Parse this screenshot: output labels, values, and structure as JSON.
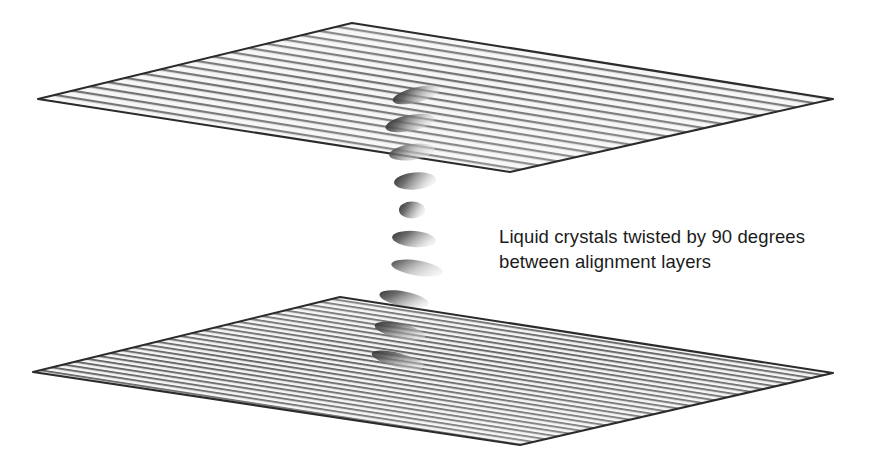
{
  "figure": {
    "width": 879,
    "height": 460,
    "background_color": "#ffffff"
  },
  "caption": {
    "line1": "Liquid crystals twisted by 90 degrees",
    "line2": "between alignment layers",
    "text_color": "#1b1b1b",
    "font_size_px": 18.5
  },
  "plates": [
    {
      "name": "top-alignment-layer",
      "label": "top alignment layer",
      "edge_color": "#2b2b2b",
      "fill_color": "#f4f4f4",
      "groove_color": "#4a4a4a",
      "groove_spacing_px": 7,
      "groove_count": 21,
      "vertices": [
        {
          "x": 352,
          "y": 23
        },
        {
          "x": 833,
          "y": 99
        },
        {
          "x": 510,
          "y": 172
        },
        {
          "x": 38,
          "y": 99
        }
      ]
    },
    {
      "name": "bottom-alignment-layer",
      "label": "bottom alignment layer",
      "edge_color": "#2b2b2b",
      "fill_color": "#f2f2f2",
      "groove_color": "#3d3d3d",
      "groove_spacing_px": 4.6,
      "groove_count": 32,
      "vertices": [
        {
          "x": 340,
          "y": 297
        },
        {
          "x": 833,
          "y": 373
        },
        {
          "x": 520,
          "y": 445
        },
        {
          "x": 33,
          "y": 372
        }
      ]
    }
  ],
  "molecules": [
    {
      "name": "lc-molecule-1",
      "cx": 416,
      "cy": 95,
      "rx": 24,
      "ry": 7.5,
      "angle": -14,
      "shade": "#6d6d6d",
      "layer": "top-plate"
    },
    {
      "name": "lc-molecule-2",
      "cx": 410,
      "cy": 123,
      "rx": 25,
      "ry": 8.0,
      "angle": -11,
      "shade": "#7a7a7a",
      "layer": "top-plate"
    },
    {
      "name": "lc-molecule-3",
      "cx": 412,
      "cy": 152,
      "rx": 23,
      "ry": 8.0,
      "angle": -8,
      "shade": "#8a8a8a",
      "layer": "top-plate"
    },
    {
      "name": "lc-molecule-4",
      "cx": 415,
      "cy": 181,
      "rx": 21,
      "ry": 8.5,
      "angle": -5,
      "shade": "#8e8e8e",
      "layer": "gap"
    },
    {
      "name": "lc-molecule-5",
      "cx": 412,
      "cy": 210,
      "rx": 13,
      "ry": 8.5,
      "angle": 0,
      "shade": "#7e7e7e",
      "layer": "gap"
    },
    {
      "name": "lc-molecule-6",
      "cx": 414,
      "cy": 239,
      "rx": 22,
      "ry": 8.0,
      "angle": 5,
      "shade": "#8a8a8a",
      "layer": "gap"
    },
    {
      "name": "lc-molecule-7",
      "cx": 417,
      "cy": 268,
      "rx": 26,
      "ry": 7.5,
      "angle": 9,
      "shade": "#9a9a9a",
      "layer": "gap"
    },
    {
      "name": "lc-molecule-8",
      "cx": 404,
      "cy": 299,
      "rx": 25,
      "ry": 7.5,
      "angle": 11,
      "shade": "#6e6e6e",
      "layer": "bottom-plate"
    },
    {
      "name": "lc-molecule-9",
      "cx": 400,
      "cy": 331,
      "rx": 26,
      "ry": 7.5,
      "angle": 13,
      "shade": "#5d5d5d",
      "layer": "bottom-plate"
    },
    {
      "name": "lc-molecule-10",
      "cx": 398,
      "cy": 360,
      "rx": 27,
      "ry": 7.0,
      "angle": 14,
      "shade": "#535353",
      "layer": "bottom-plate"
    }
  ],
  "twist": {
    "degrees": 90,
    "description": "90 degree twist of the nematic director from the top alignment layer to the bottom alignment layer"
  }
}
